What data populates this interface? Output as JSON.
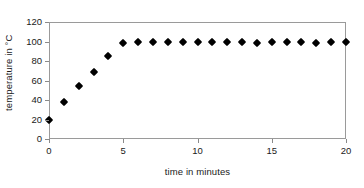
{
  "chart_data": {
    "type": "scatter",
    "title": "",
    "xlabel": "time in minutes",
    "ylabel": "temperature in °C",
    "xlim": [
      0,
      20
    ],
    "ylim": [
      0,
      120
    ],
    "xticks": [
      0,
      5,
      10,
      15,
      20
    ],
    "xtick_labels": [
      "0",
      "5",
      "10",
      "15",
      "20"
    ],
    "yticks": [
      0,
      20,
      40,
      60,
      80,
      100,
      120
    ],
    "ytick_labels": [
      "0",
      "20",
      "40",
      "60",
      "80",
      "100",
      "120"
    ],
    "grid": false,
    "legend": false,
    "marker": "diamond",
    "marker_color": "#000000",
    "frame_color": "#9a9a9a",
    "background": "#ffffff",
    "x": [
      0,
      1,
      2,
      3,
      4,
      5,
      6,
      7,
      8,
      9,
      10,
      11,
      12,
      13,
      14,
      15,
      16,
      17,
      18,
      19,
      20
    ],
    "values": [
      20,
      38,
      54,
      69,
      85,
      98,
      99,
      100,
      100,
      100,
      99,
      100,
      100,
      100,
      98,
      99,
      100,
      100,
      98,
      99,
      100
    ],
    "series": [
      {
        "name": "temperature",
        "values": [
          20,
          38,
          54,
          69,
          85,
          98,
          99,
          100,
          100,
          100,
          99,
          100,
          100,
          100,
          98,
          99,
          100,
          100,
          98,
          99,
          100
        ]
      }
    ]
  }
}
